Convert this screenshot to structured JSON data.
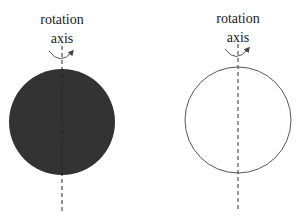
{
  "diagram": {
    "left": {
      "label_line1": "rotation",
      "label_line2": "axis",
      "sphere_style": "filled",
      "fill_color": "#333333"
    },
    "right": {
      "label_line1": "rotation",
      "label_line2": "axis",
      "sphere_style": "outline",
      "stroke_color": "#555555"
    },
    "axis_color": "#333333"
  }
}
